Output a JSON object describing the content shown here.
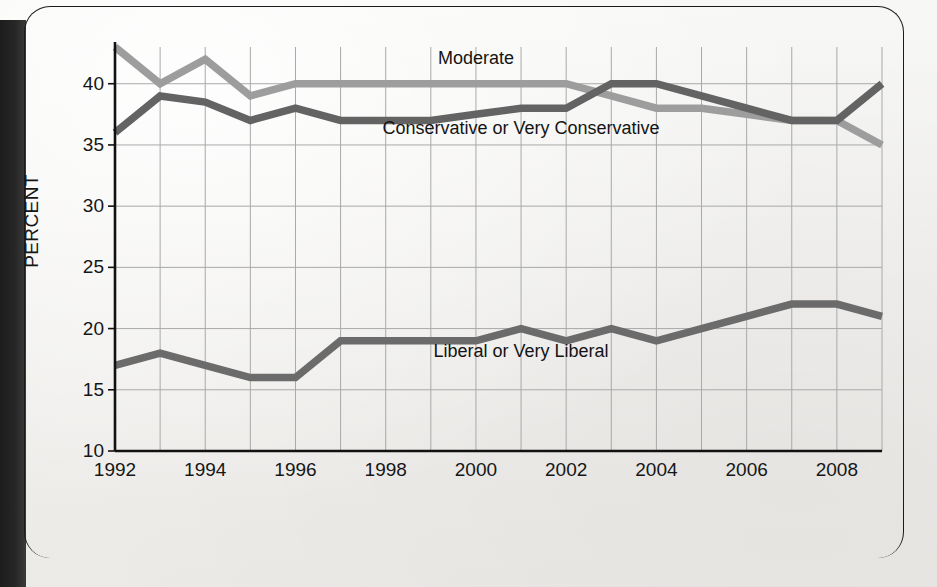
{
  "figure": {
    "background_color": "#f2f1ef",
    "frame_color": "#1b1b1b",
    "gutter_color": "#232323"
  },
  "chart_data": {
    "type": "line",
    "title": "",
    "xlabel": "",
    "ylabel": "PERCENT",
    "x": [
      1992,
      1993,
      1994,
      1995,
      1996,
      1997,
      1998,
      1999,
      2000,
      2001,
      2002,
      2003,
      2004,
      2005,
      2006,
      2007,
      2008,
      2009
    ],
    "xlim": [
      1992,
      2009
    ],
    "ylim": [
      10,
      43
    ],
    "ytick_labels": [
      "10",
      "15",
      "20",
      "25",
      "30",
      "35",
      "40"
    ],
    "yticks": [
      10,
      15,
      20,
      25,
      30,
      35,
      40
    ],
    "xtick_labels": [
      "1992",
      "1994",
      "1996",
      "1998",
      "2000",
      "2002",
      "2004",
      "2006",
      "2008"
    ],
    "xticks": [
      1992,
      1994,
      1996,
      1998,
      2000,
      2002,
      2004,
      2006,
      2008
    ],
    "grid": true,
    "legend_position": "inline-labels",
    "series": [
      {
        "name": "Moderate",
        "color": "#9d9d9d",
        "label_x": 2000,
        "label_y": 42.0,
        "values": [
          43.0,
          40.0,
          42.0,
          39.0,
          40.0,
          40.0,
          40.0,
          40.0,
          40.0,
          40.0,
          40.0,
          39.0,
          38.0,
          38.0,
          37.5,
          37.0,
          37.0,
          35.0
        ]
      },
      {
        "name": "Conservative or Very Conservative",
        "color": "#636363",
        "label_x": 2001,
        "label_y": 36.3,
        "values": [
          36.0,
          39.0,
          38.5,
          37.0,
          38.0,
          37.0,
          37.0,
          37.0,
          37.5,
          38.0,
          38.0,
          40.0,
          40.0,
          39.0,
          38.0,
          37.0,
          37.0,
          40.0
        ]
      },
      {
        "name": "Liberal or Very Liberal",
        "color": "#6b6b6b",
        "label_x": 2001,
        "label_y": 18.1,
        "values": [
          17.0,
          18.0,
          17.0,
          16.0,
          16.0,
          19.0,
          19.0,
          19.0,
          19.0,
          20.0,
          19.0,
          20.0,
          19.0,
          20.0,
          21.0,
          22.0,
          22.0,
          21.0
        ]
      }
    ]
  }
}
